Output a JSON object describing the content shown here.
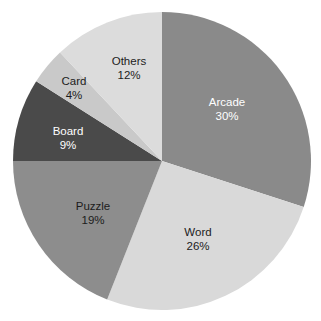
{
  "chart_data": {
    "type": "pie",
    "title": "",
    "subtitle": "",
    "xlabel": "",
    "ylabel": "",
    "legend_position": "none",
    "grid": false,
    "labels_inside_slices": true,
    "start_angle_deg": 0,
    "direction": "clockwise",
    "categories": [
      "Arcade",
      "Word",
      "Puzzle",
      "Board",
      "Card",
      "Others"
    ],
    "values": [
      30,
      26,
      19,
      9,
      4,
      12
    ],
    "value_unit": "%",
    "slices": [
      {
        "label": "Arcade",
        "value": 30,
        "value_text": "30%",
        "color": "#8a8a8a",
        "text_color": "#ffffff",
        "label_x": 227,
        "label_y": 103
      },
      {
        "label": "Word",
        "value": 26,
        "value_text": "26%",
        "color": "#d9d9d9",
        "text_color": "#1c1c1c",
        "label_x": 198,
        "label_y": 233
      },
      {
        "label": "Puzzle",
        "value": 19,
        "value_text": "19%",
        "color": "#8d8d8d",
        "text_color": "#1c1c1c",
        "label_x": 93,
        "label_y": 207
      },
      {
        "label": "Board",
        "value": 9,
        "value_text": "9%",
        "color": "#4a4a4a",
        "text_color": "#ffffff",
        "label_x": 68,
        "label_y": 132
      },
      {
        "label": "Card",
        "value": 4,
        "value_text": "4%",
        "color": "#c9c9c9",
        "text_color": "#1c1c1c",
        "label_x": 74,
        "label_y": 82
      },
      {
        "label": "Others",
        "value": 12,
        "value_text": "12%",
        "color": "#dcdcdc",
        "text_color": "#1c1c1c",
        "label_x": 129,
        "label_y": 62
      }
    ],
    "geometry": {
      "center_x": 162,
      "center_y": 161,
      "radius": 149
    },
    "background_color": "#ffffff"
  }
}
